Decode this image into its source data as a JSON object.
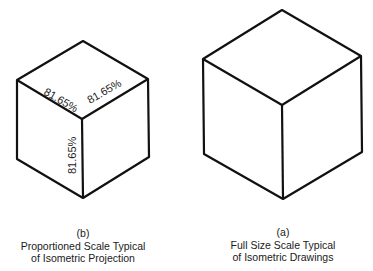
{
  "figures": {
    "b": {
      "letter": "(b)",
      "line1": "Proportioned Scale Typical",
      "line2": "of Isometric Projection",
      "labels": {
        "top_left": "81.65%",
        "top_right": "81.65%",
        "vertical": "81.65%"
      }
    },
    "a": {
      "letter": "(a)",
      "line1": "Full Size Scale Typical",
      "line2": "of Isometric Drawings"
    }
  }
}
